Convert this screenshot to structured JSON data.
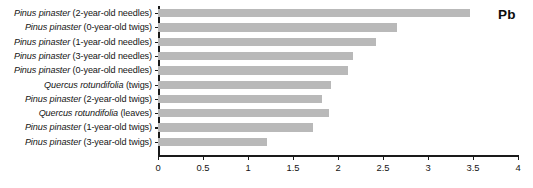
{
  "chart_data": {
    "type": "bar",
    "orientation": "horizontal",
    "title": "",
    "annotation": "Pb",
    "xlabel": "",
    "ylabel": "",
    "xlim": [
      0,
      4
    ],
    "grid": false,
    "legend": null,
    "bar_color": "#b9b9b9",
    "axis_color": "#1a1a1a",
    "xticks": [
      "0",
      "0.5",
      "1",
      "1.5",
      "2",
      "2.5",
      "3",
      "3.5",
      "4"
    ],
    "xtick_values": [
      0,
      0.5,
      1,
      1.5,
      2,
      2.5,
      3,
      3.5,
      4
    ],
    "categories": [
      "Pinus pinaster (2-year-old needles)",
      "Pinus pinaster (0-year-old twigs)",
      "Pinus pinaster (1-year-old needles)",
      "Pinus pinaster (3-year-old needles)",
      "Pinus pinaster (0-year-old needles)",
      "Quercus rotundifolia (twigs)",
      "Pinus pinaster (2-year-old twigs)",
      "Quercus rotundifolia (leaves)",
      "Pinus pinaster (1-year-old twigs)",
      "Pinus pinaster (3-year-old twigs)"
    ],
    "values": [
      3.47,
      2.66,
      2.42,
      2.17,
      2.11,
      1.92,
      1.82,
      1.9,
      1.72,
      1.21
    ],
    "category_parts": [
      {
        "species": "Pinus pinaster",
        "detail": " (2-year-old needles)"
      },
      {
        "species": "Pinus pinaster",
        "detail": " (0-year-old twigs)"
      },
      {
        "species": "Pinus pinaster",
        "detail": " (1-year-old needles)"
      },
      {
        "species": "Pinus pinaster",
        "detail": " (3-year-old needles)"
      },
      {
        "species": "Pinus pinaster",
        "detail": " (0-year-old needles)"
      },
      {
        "species": "Quercus rotundifolia",
        "detail": " (twigs)"
      },
      {
        "species": "Pinus pinaster",
        "detail": " (2-year-old twigs)"
      },
      {
        "species": "Quercus rotundifolia",
        "detail": " (leaves)"
      },
      {
        "species": "Pinus pinaster",
        "detail": " (1-year-old twigs)"
      },
      {
        "species": "Pinus pinaster",
        "detail": " (3-year-old twigs)"
      }
    ]
  }
}
